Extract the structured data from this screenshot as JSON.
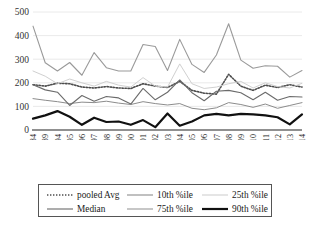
{
  "chart_data": {
    "type": "line",
    "title": "",
    "xlabel": "",
    "ylabel": "",
    "ylim": [
      0,
      500
    ],
    "yticks": [
      0,
      100,
      200,
      300,
      400,
      500
    ],
    "grid": true,
    "legend_position": "bottom",
    "categories": [
      "1980–84",
      "1985–89",
      "1994",
      "1995",
      "1996",
      "1997",
      "1998",
      "1999",
      "2000",
      "2001",
      "2002",
      "2003",
      "2004",
      "2005",
      "2006",
      "2007",
      "2008",
      "2009",
      "2010",
      "2011",
      "2012",
      "2013",
      "2014"
    ],
    "series": [
      {
        "name": "pooled Avg",
        "style": "dotted",
        "color": "#4d4d4d",
        "width": 1.6,
        "values": [
          192,
          186,
          198,
          196,
          182,
          178,
          184,
          178,
          176,
          196,
          186,
          180,
          206,
          168,
          156,
          152,
          236,
          186,
          168,
          190,
          180,
          192,
          182
        ]
      },
      {
        "name": "10th %ile",
        "style": "solid",
        "color": "#8c8c8c",
        "width": 1.0,
        "values": [
          133,
          126,
          120,
          112,
          118,
          116,
          122,
          114,
          108,
          120,
          112,
          106,
          112,
          92,
          86,
          94,
          116,
          108,
          96,
          110,
          92,
          104,
          116
        ]
      },
      {
        "name": "25th %ile",
        "style": "solid",
        "color": "#d0d0d0",
        "width": 1.0,
        "values": [
          250,
          228,
          196,
          216,
          200,
          186,
          206,
          190,
          182,
          222,
          186,
          182,
          280,
          196,
          176,
          182,
          196,
          206,
          178,
          200,
          184,
          178,
          198
        ]
      },
      {
        "name": "Median",
        "style": "solid",
        "color": "#6b6b6b",
        "width": 1.1,
        "values": [
          192,
          170,
          160,
          104,
          146,
          122,
          142,
          136,
          110,
          176,
          128,
          160,
          212,
          158,
          124,
          164,
          168,
          158,
          128,
          160,
          126,
          142,
          140
        ]
      },
      {
        "name": "75th %ile",
        "style": "solid",
        "color": "#9a9a9a",
        "width": 1.1,
        "values": [
          440,
          285,
          250,
          286,
          232,
          328,
          264,
          250,
          250,
          362,
          354,
          252,
          384,
          278,
          244,
          318,
          450,
          296,
          262,
          272,
          270,
          224,
          252
        ]
      },
      {
        "name": "90th %ile",
        "style": "solid-thick",
        "color": "#111111",
        "width": 2.2,
        "values": [
          48,
          62,
          80,
          56,
          22,
          52,
          34,
          36,
          22,
          42,
          12,
          70,
          18,
          36,
          62,
          68,
          62,
          68,
          66,
          62,
          54,
          24,
          66
        ]
      }
    ]
  },
  "legend": {
    "entries": [
      {
        "label": "pooled Avg",
        "style": "dotted",
        "color": "#4d4d4d"
      },
      {
        "label": "10th %ile",
        "style": "solid",
        "color": "#8c8c8c"
      },
      {
        "label": "25th %ile",
        "style": "solid",
        "color": "#d0d0d0"
      },
      {
        "label": "Median",
        "style": "solid",
        "color": "#6b6b6b"
      },
      {
        "label": "75th %ile",
        "style": "solid",
        "color": "#9a9a9a"
      },
      {
        "label": "90th %ile",
        "style": "solid-thick",
        "color": "#111111"
      }
    ]
  }
}
